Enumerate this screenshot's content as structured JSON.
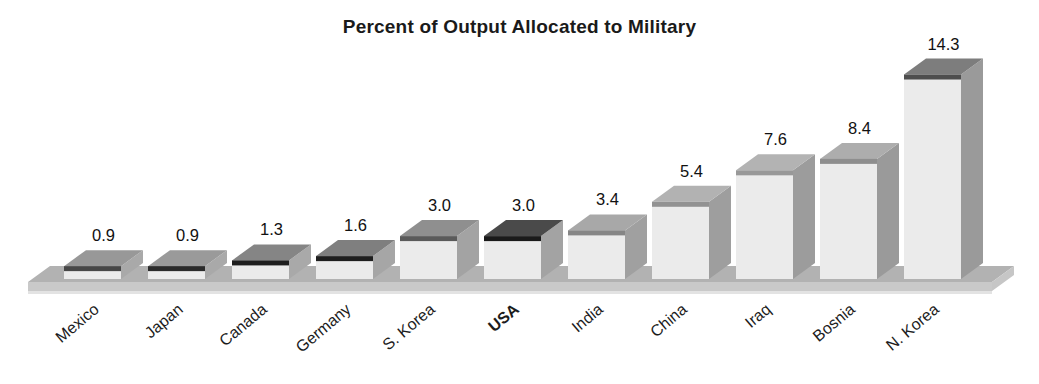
{
  "page": {
    "background": "#ffffff"
  },
  "chart_data": {
    "type": "bar",
    "projection": "oblique-3d",
    "title": "Percent of Output Allocated to Military",
    "xlabel": "",
    "ylabel": "",
    "ylim": [
      0,
      15
    ],
    "grid": false,
    "legend": "none",
    "categories": [
      "Mexico",
      "Japan",
      "Canada",
      "Germany",
      "S. Korea",
      "USA",
      "India",
      "China",
      "Iraq",
      "Bosnia",
      "N. Korea"
    ],
    "values": [
      0.9,
      0.9,
      1.3,
      1.6,
      3.0,
      3.0,
      3.4,
      5.4,
      7.6,
      8.4,
      14.3
    ],
    "value_labels": [
      "0.9",
      "0.9",
      "1.3",
      "1.6",
      "3.0",
      "3.0",
      "3.4",
      "5.4",
      "7.6",
      "8.4",
      "14.3"
    ],
    "emphasized_category": "USA",
    "bar_styles": [
      {
        "top": "#989898",
        "edge": "#474747",
        "side": "#a9a9a9"
      },
      {
        "top": "#9a9a9a",
        "edge": "#2a2a2a",
        "side": "#a9a9a9"
      },
      {
        "top": "#858585",
        "edge": "#1e1e1e",
        "side": "#a9a9a9"
      },
      {
        "top": "#7f7f7f",
        "edge": "#1e1e1e",
        "side": "#a6a6a6"
      },
      {
        "top": "#8f8f8f",
        "edge": "#5a5a5a",
        "side": "#a3a3a3"
      },
      {
        "top": "#4a4a4a",
        "edge": "#1a1a1a",
        "side": "#a3a3a3"
      },
      {
        "top": "#a8a8a8",
        "edge": "#868686",
        "side": "#a0a0a0"
      },
      {
        "top": "#b2b2b2",
        "edge": "#929292",
        "side": "#9e9e9e"
      },
      {
        "top": "#b3b3b3",
        "edge": "#989898",
        "side": "#9c9c9c"
      },
      {
        "top": "#adadad",
        "edge": "#8e8e8e",
        "side": "#9a9a9a"
      },
      {
        "top": "#7d7d7d",
        "edge": "#4e4e4e",
        "side": "#9a9a9a"
      }
    ],
    "colors": {
      "bar_front": "#ebebeb",
      "platform_top": "#b2b2b2",
      "platform_front": "#c9c9c9",
      "platform_end": "#c6c6c6",
      "platform_shadow": "#e3e3e3",
      "title_text": "#1a1a1a",
      "value_text": "#111111",
      "category_text": "#1c1c1c",
      "background": "#ffffff"
    }
  }
}
